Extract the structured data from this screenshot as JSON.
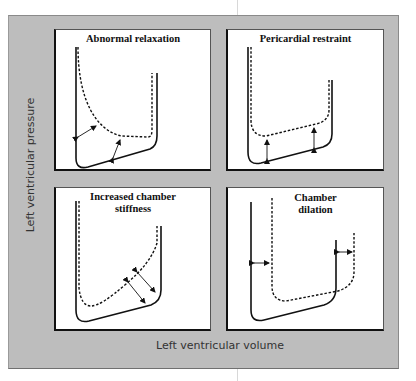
{
  "figure": {
    "y_axis_label": "Left ventricular pressure",
    "x_axis_label": "Left ventricular volume",
    "colors": {
      "frame_background": "#bdbdbd",
      "panel_background": "#ffffff",
      "line": "#111111"
    },
    "panels": [
      {
        "id": "abnormal-relaxation",
        "title_line1": "Abnormal relaxation",
        "title_line2": "",
        "legend": {
          "solid": "normal",
          "dashed": "abnormal"
        }
      },
      {
        "id": "pericardial-restraint",
        "title_line1": "Pericardial restraint",
        "title_line2": ""
      },
      {
        "id": "increased-chamber-stiffness",
        "title_line1": "Increased chamber",
        "title_line2": "stiffness"
      },
      {
        "id": "chamber-dilation",
        "title_line1": "Chamber",
        "title_line2": "dilation"
      }
    ]
  }
}
